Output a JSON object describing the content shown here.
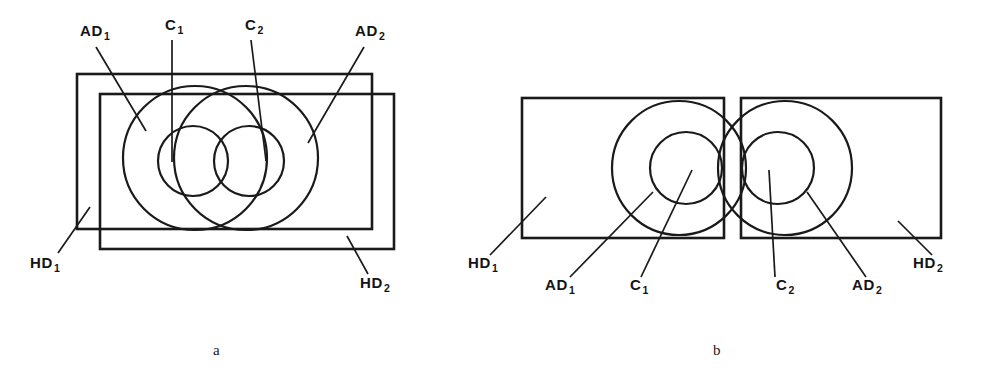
{
  "figure": {
    "caption_a": "a",
    "caption_b": "b",
    "stroke_color": "#1a1a1a",
    "background_color": "#ffffff"
  },
  "panel_a": {
    "name": "panel-a",
    "labels": {
      "ad1": {
        "text": "AD",
        "sub": "1",
        "x": 80,
        "y": 36
      },
      "c1": {
        "text": "C",
        "sub": "1",
        "x": 165,
        "y": 30
      },
      "c2": {
        "text": "C",
        "sub": "2",
        "x": 245,
        "y": 30
      },
      "ad2": {
        "text": "AD",
        "sub": "2",
        "x": 355,
        "y": 36
      },
      "hd1": {
        "text": "HD",
        "sub": "1",
        "x": 30,
        "y": 268
      },
      "hd2": {
        "text": "HD",
        "sub": "2",
        "x": 360,
        "y": 288
      }
    },
    "rect_hd1": {
      "x": 77,
      "y": 74,
      "w": 295,
      "h": 155
    },
    "rect_hd2": {
      "x": 100,
      "y": 94,
      "w": 294,
      "h": 155
    },
    "circle_ad1": {
      "cx": 195,
      "cy": 158,
      "r": 72
    },
    "circle_ad2": {
      "cx": 246,
      "cy": 158,
      "r": 72
    },
    "circle_c1": {
      "cx": 193,
      "cy": 161,
      "r": 35
    },
    "circle_c2": {
      "cx": 249,
      "cy": 161,
      "r": 35
    }
  },
  "panel_b": {
    "name": "panel-b",
    "labels": {
      "hd1": {
        "text": "HD",
        "sub": "1",
        "x": 468,
        "y": 268
      },
      "ad1": {
        "text": "AD",
        "sub": "1",
        "x": 545,
        "y": 290
      },
      "c1": {
        "text": "C",
        "sub": "1",
        "x": 630,
        "y": 290
      },
      "c2": {
        "text": "C",
        "sub": "2",
        "x": 776,
        "y": 290
      },
      "ad2": {
        "text": "AD",
        "sub": "2",
        "x": 852,
        "y": 290
      },
      "hd2": {
        "text": "HD",
        "sub": "2",
        "x": 913,
        "y": 268
      }
    },
    "rect_hd1": {
      "x": 522,
      "y": 98,
      "w": 202,
      "h": 140
    },
    "rect_hd2": {
      "x": 741,
      "y": 98,
      "w": 200,
      "h": 140
    },
    "circle_ad1": {
      "cx": 679,
      "cy": 168,
      "r": 67
    },
    "circle_ad2": {
      "cx": 785,
      "cy": 168,
      "r": 67
    },
    "circle_c1": {
      "cx": 686,
      "cy": 168,
      "r": 36
    },
    "circle_c2": {
      "cx": 778,
      "cy": 168,
      "r": 36
    }
  },
  "captions": {
    "a": {
      "text": "a",
      "x": 213,
      "y": 355
    },
    "b": {
      "text": "b",
      "x": 713,
      "y": 355
    }
  }
}
